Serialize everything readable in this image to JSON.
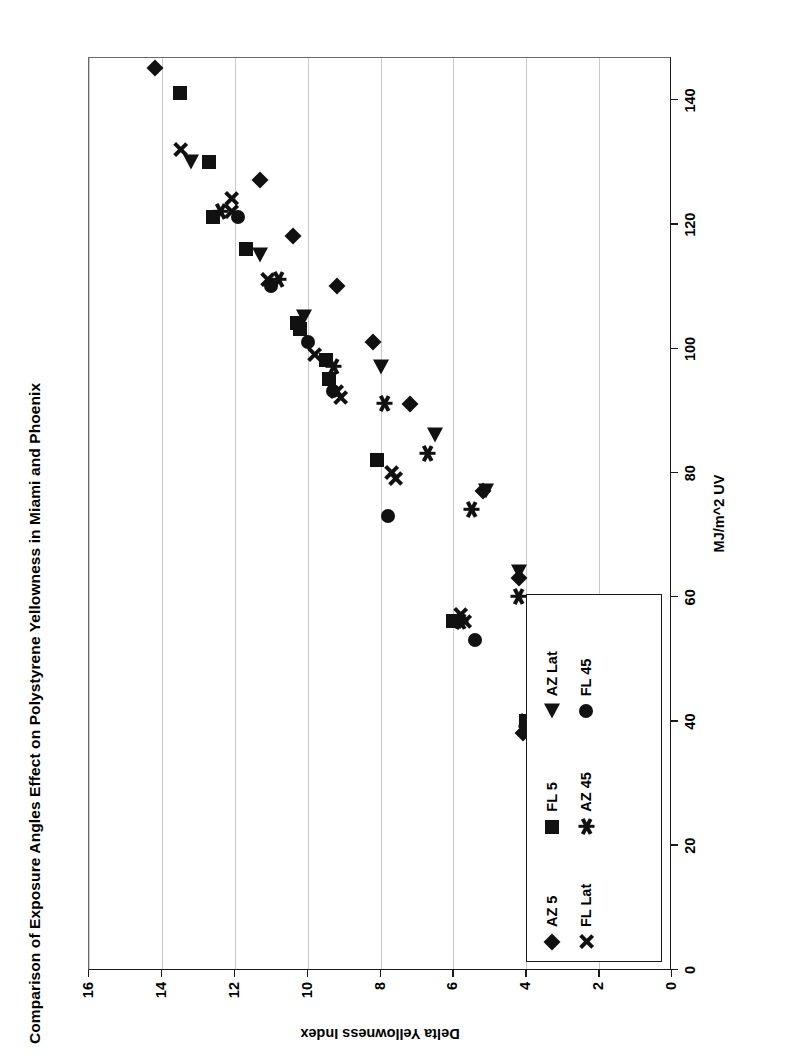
{
  "chart_data": {
    "type": "scatter",
    "title": "Comparison of Exposure Angles Effect on Polystyrene Yellowness in Miami and Phoenix",
    "xlabel": "MJ/m^2 UV",
    "ylabel": "Delta Yellowness Index",
    "xlim": [
      0,
      147
    ],
    "ylim": [
      0,
      16
    ],
    "xticks": [
      "0",
      "20",
      "40",
      "60",
      "80",
      "100",
      "120",
      "140"
    ],
    "xtick_values": [
      0,
      20,
      40,
      60,
      80,
      100,
      120,
      140
    ],
    "yticks": [
      "0",
      "2",
      "4",
      "6",
      "8",
      "10",
      "12",
      "14",
      "16"
    ],
    "ytick_values": [
      0,
      2,
      4,
      6,
      8,
      10,
      12,
      14,
      16
    ],
    "grid": "vertical-on-value-axis",
    "legend_position": "inside-lower-left",
    "orientation": "page-rotated-90-ccw",
    "series": [
      {
        "name": "AZ 5",
        "marker": "diamond",
        "color": "#111111",
        "points": [
          [
            32,
            1.9
          ],
          [
            38,
            4.1
          ],
          [
            63,
            4.2
          ],
          [
            77,
            5.2
          ],
          [
            91,
            7.2
          ],
          [
            101,
            8.2
          ],
          [
            110,
            9.2
          ],
          [
            118,
            10.4
          ],
          [
            127,
            11.3
          ],
          [
            145,
            14.2
          ]
        ]
      },
      {
        "name": "FL 5",
        "marker": "square",
        "color": "#111111",
        "points": [
          [
            40,
            4.0
          ],
          [
            56,
            6.0
          ],
          [
            82,
            8.1
          ],
          [
            95,
            9.4
          ],
          [
            98,
            9.5
          ],
          [
            103,
            10.2
          ],
          [
            104,
            10.3
          ],
          [
            116,
            11.7
          ],
          [
            121,
            12.6
          ],
          [
            130,
            12.7
          ],
          [
            141,
            13.5
          ]
        ]
      },
      {
        "name": "AZ Lat",
        "marker": "triangle",
        "color": "#111111",
        "points": [
          [
            35,
            1.9
          ],
          [
            48,
            3.1
          ],
          [
            64,
            4.2
          ],
          [
            77,
            5.1
          ],
          [
            86,
            6.5
          ],
          [
            97,
            8.0
          ],
          [
            105,
            10.1
          ],
          [
            115,
            11.3
          ],
          [
            130,
            13.2
          ]
        ]
      },
      {
        "name": "FL Lat",
        "marker": "x",
        "color": "#111111",
        "points": [
          [
            40,
            4.0
          ],
          [
            56,
            5.7
          ],
          [
            57,
            5.8
          ],
          [
            79,
            7.6
          ],
          [
            80,
            7.7
          ],
          [
            92,
            9.1
          ],
          [
            93,
            9.2
          ],
          [
            99,
            9.8
          ],
          [
            111,
            11.1
          ],
          [
            122,
            12.1
          ],
          [
            124,
            12.1
          ],
          [
            132,
            13.5
          ]
        ]
      },
      {
        "name": "AZ 45",
        "marker": "star",
        "color": "#111111",
        "points": [
          [
            34,
            1.9
          ],
          [
            39,
            4.0
          ],
          [
            56,
            5.8
          ],
          [
            60,
            4.2
          ],
          [
            74,
            5.5
          ],
          [
            83,
            6.7
          ],
          [
            91,
            7.9
          ],
          [
            97,
            9.3
          ],
          [
            111,
            10.8
          ],
          [
            122,
            12.4
          ]
        ]
      },
      {
        "name": "FL 45",
        "marker": "circle",
        "color": "#111111",
        "points": [
          [
            53,
            5.4
          ],
          [
            73,
            7.8
          ],
          [
            82,
            8.1
          ],
          [
            93,
            9.3
          ],
          [
            101,
            10.0
          ],
          [
            110,
            11.0
          ],
          [
            121,
            11.9
          ]
        ]
      }
    ]
  },
  "legend": {
    "items": [
      {
        "label": "AZ 5",
        "marker": "diamond"
      },
      {
        "label": "FL 5",
        "marker": "square"
      },
      {
        "label": "AZ Lat",
        "marker": "triangle"
      },
      {
        "label": "FL Lat",
        "marker": "x"
      },
      {
        "label": "AZ 45",
        "marker": "star"
      },
      {
        "label": "FL 45",
        "marker": "circle"
      }
    ]
  },
  "colors": {
    "marker": "#111111",
    "axis": "#1a1a1a",
    "grid": "#c9c9c9",
    "background": "#ffffff"
  }
}
